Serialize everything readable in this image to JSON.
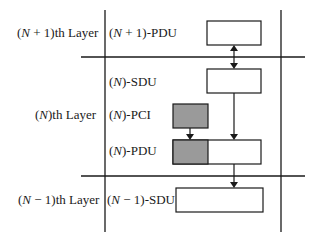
{
  "diagram": {
    "layers": [
      {
        "id": "n_plus_1",
        "label_pre": "(",
        "var": "N",
        "label_post": " + 1)th Layer"
      },
      {
        "id": "n",
        "label_pre": "(",
        "var": "N",
        "label_post": ")th Layer"
      },
      {
        "id": "n_minus_1",
        "label_pre": "(",
        "var": "N",
        "label_post": " − 1)th Layer"
      }
    ],
    "units": [
      {
        "id": "n_plus_1_pdu",
        "label_pre": "(",
        "var": "N",
        "label_post": " + 1)-PDU"
      },
      {
        "id": "n_sdu",
        "label_pre": "(",
        "var": "N",
        "label_post": ")-SDU"
      },
      {
        "id": "n_pci",
        "label_pre": "(",
        "var": "N",
        "label_post": ")-PCI"
      },
      {
        "id": "n_pdu",
        "label_pre": "(",
        "var": "N",
        "label_post": ")-PDU"
      },
      {
        "id": "n_minus_1_sdu",
        "label_pre": "(",
        "var": "N",
        "label_post": " − 1)-SDU"
      }
    ],
    "colors": {
      "line": "#1a1a1a",
      "box_fill": "#ffffff",
      "pci_fill": "#9a9a9a"
    }
  }
}
